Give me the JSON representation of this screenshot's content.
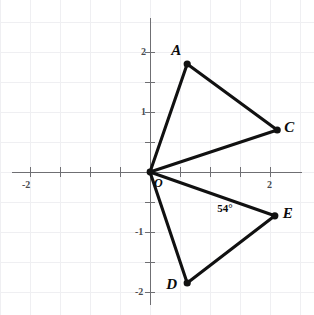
{
  "chart_data": {
    "type": "scatter",
    "title": "",
    "xlabel": "",
    "ylabel": "",
    "xlim": [
      -2.5,
      2.7
    ],
    "ylim": [
      -2.4,
      2.4
    ],
    "grid": true,
    "grid_step": 0.5,
    "legend": "none",
    "axes": {
      "origin_label": "O",
      "x_ticks": [
        {
          "value": -2,
          "label": "-2"
        },
        {
          "value": -1.5,
          "label": ""
        },
        {
          "value": -1,
          "label": ""
        },
        {
          "value": -0.5,
          "label": ""
        },
        {
          "value": 0.5,
          "label": ""
        },
        {
          "value": 1,
          "label": ""
        },
        {
          "value": 1.5,
          "label": ""
        },
        {
          "value": 2,
          "label": "2"
        }
      ],
      "y_ticks": [
        {
          "value": 2,
          "label": "2"
        },
        {
          "value": 1.5,
          "label": ""
        },
        {
          "value": 1,
          "label": "1"
        },
        {
          "value": 0.5,
          "label": ""
        },
        {
          "value": -0.5,
          "label": ""
        },
        {
          "value": -1,
          "label": "-1"
        },
        {
          "value": -1.5,
          "label": ""
        },
        {
          "value": -2,
          "label": "-2"
        }
      ]
    },
    "points": [
      {
        "name": "O",
        "label": "O",
        "x": 0,
        "y": 0,
        "label_dx": 4,
        "label_dy": 4
      },
      {
        "name": "A",
        "label": "A",
        "x": 0.62,
        "y": 1.8,
        "label_dx": -16,
        "label_dy": -22
      },
      {
        "name": "C",
        "label": "C",
        "x": 2.12,
        "y": 0.7,
        "label_dx": 7,
        "label_dy": -11
      },
      {
        "name": "E",
        "label": "E",
        "x": 2.08,
        "y": -0.73,
        "label_dx": 8,
        "label_dy": -11
      },
      {
        "name": "D",
        "label": "D",
        "x": 0.62,
        "y": -1.85,
        "label_dx": -21,
        "label_dy": -7
      }
    ],
    "segments": [
      {
        "name": "segment-OA",
        "from": "O",
        "to": "A"
      },
      {
        "name": "segment-AC",
        "from": "A",
        "to": "C"
      },
      {
        "name": "segment-OC",
        "from": "O",
        "to": "C"
      },
      {
        "name": "segment-OE",
        "from": "O",
        "to": "E"
      },
      {
        "name": "segment-DE",
        "from": "D",
        "to": "E"
      },
      {
        "name": "segment-OD",
        "from": "O",
        "to": "D"
      }
    ],
    "annotations": [
      {
        "name": "angle-54",
        "text": "54°",
        "x": 1.32,
        "y": -0.62
      }
    ]
  },
  "labels": {
    "x_tick_neg2": "-2",
    "x_tick_2": "2",
    "y_tick_2": "2",
    "y_tick_1": "1",
    "y_tick_neg1": "-1",
    "y_tick_neg2": "-2",
    "point_a": "A",
    "point_c": "C",
    "point_d": "D",
    "point_e": "E",
    "point_o": "O",
    "angle_54": "54°"
  },
  "colors": {
    "segment": "#111111",
    "axis": "#6f6f73",
    "grid": "#efeff2",
    "background": "#ffffff"
  }
}
